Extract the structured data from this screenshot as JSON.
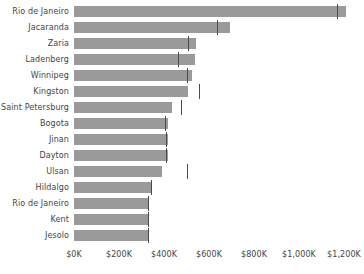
{
  "chart_data": {
    "type": "bar",
    "orientation": "horizontal",
    "title": "",
    "subtitle": "",
    "xlabel": "",
    "ylabel": "",
    "grid": false,
    "legend": "none",
    "xlim": [
      0,
      1220000
    ],
    "axis_ticks": [
      {
        "label": "$0K",
        "value": 0
      },
      {
        "label": "$200K",
        "value": 200000
      },
      {
        "label": "$400K",
        "value": 400000
      },
      {
        "label": "$600K",
        "value": 600000
      },
      {
        "label": "$800K",
        "value": 800000
      },
      {
        "label": "$1,000K",
        "value": 1000000
      },
      {
        "label": "$1,200K",
        "value": 1200000
      }
    ],
    "categories": [
      "Rio de Janeiro",
      "Jacaranda",
      "Zaria",
      "Ladenberg",
      "Winnipeg",
      "Kingston",
      "Saint Petersburg",
      "Bogota",
      "Jinan",
      "Dayton",
      "Ulsan",
      "Hildalgo",
      "Rio de Janeiro",
      "Kent",
      "Jesolo"
    ],
    "values": [
      1208000,
      693000,
      542000,
      538000,
      524000,
      507000,
      436000,
      418000,
      418000,
      418000,
      391000,
      347000,
      329000,
      329000,
      329000
    ],
    "markers": [
      1169000,
      636000,
      507000,
      462000,
      502000,
      556000,
      476000,
      404000,
      409000,
      409000,
      502000,
      342000,
      329000,
      329000,
      329000
    ],
    "series": [
      {
        "name": "Value",
        "values": [
          1208000,
          693000,
          542000,
          538000,
          524000,
          507000,
          436000,
          418000,
          418000,
          418000,
          391000,
          347000,
          329000,
          329000,
          329000
        ]
      },
      {
        "name": "Reference",
        "values": [
          1169000,
          636000,
          507000,
          462000,
          502000,
          556000,
          476000,
          404000,
          409000,
          409000,
          502000,
          342000,
          329000,
          329000,
          329000
        ]
      }
    ],
    "colors": {
      "bar": "#9a9a9a",
      "marker": "#4a4a4a",
      "text": "#444444",
      "background": "#ffffff"
    }
  }
}
